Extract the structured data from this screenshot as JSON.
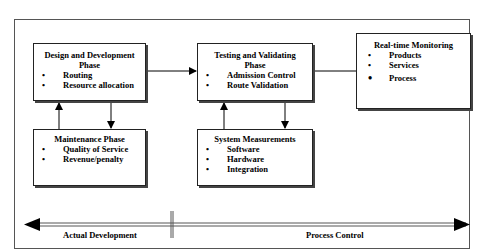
{
  "diagram": {
    "boxes": {
      "design": {
        "title": "Design and Development Phase",
        "title_line1": "Design and Development",
        "title_line2": "Phase",
        "items": [
          "Routing",
          "Resource allocation"
        ]
      },
      "testing": {
        "title": "Testing and Validating Phase",
        "title_line1": "Testing and Validating",
        "title_line2": "Phase",
        "items": [
          "Admission Control",
          "Route Validation"
        ]
      },
      "monitoring": {
        "title": "Real-time Monitoring",
        "items": [
          "Products",
          "Services",
          "Process"
        ]
      },
      "maintenance": {
        "title": "Maintenance Phase",
        "items": [
          "Quality of Service",
          "Revenue/penalty"
        ]
      },
      "measurements": {
        "title": "System Measurements",
        "items": [
          "Software",
          "Hardware",
          "Integration"
        ]
      }
    },
    "timeline": {
      "left_label": "Actual Development",
      "right_label": "Process Control"
    },
    "colors": {
      "line": "#000000",
      "frame": "#555555",
      "shadow": "#444444"
    }
  }
}
